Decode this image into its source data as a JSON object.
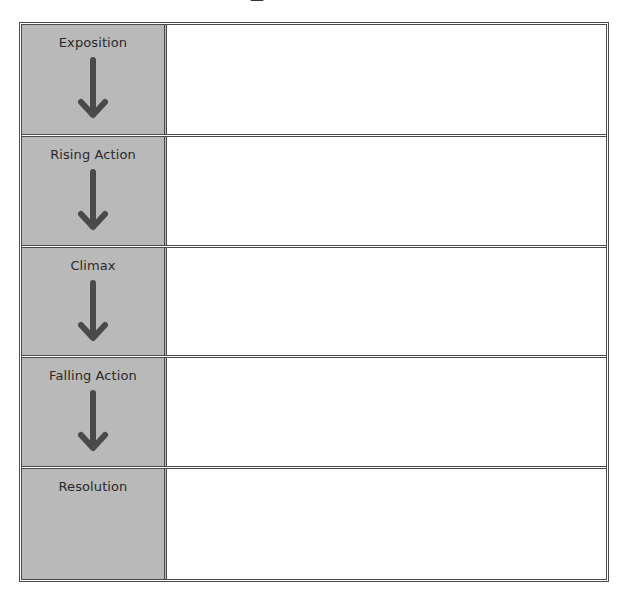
{
  "diagram": {
    "colors": {
      "label_background": "#b9b9b9",
      "border": "#4a4a4a",
      "arrow": "#4a4a4a",
      "content_background": "#ffffff"
    },
    "stages": [
      {
        "label": "Exposition",
        "arrow": "down-arrow-icon",
        "notes": ""
      },
      {
        "label": "Rising Action",
        "arrow": "down-arrow-icon",
        "notes": ""
      },
      {
        "label": "Climax",
        "arrow": "down-arrow-icon",
        "notes": ""
      },
      {
        "label": "Falling Action",
        "arrow": "down-arrow-icon",
        "notes": ""
      },
      {
        "label": "Resolution",
        "arrow": null,
        "notes": ""
      }
    ]
  }
}
